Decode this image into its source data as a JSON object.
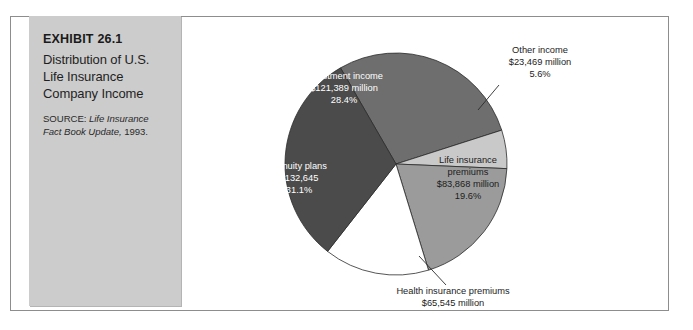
{
  "exhibit": {
    "number": "EXHIBIT 26.1",
    "title": "Distribution of U.S. Life Insurance Company Income",
    "source_label": "SOURCE: ",
    "source_title": "Life Insurance Fact Book Update,",
    "source_year": " 1993."
  },
  "chart_data": {
    "type": "pie",
    "title": "Distribution of U.S. Life Insurance Company Income",
    "xlabel": "",
    "ylabel": "",
    "legend_position": "labels-on-slices",
    "grid": false,
    "units": "millions of U.S. dollars",
    "categories": [
      "Investment income",
      "Other income",
      "Life insurance premiums",
      "Health insurance premiums",
      "Annuity plans"
    ],
    "values": [
      121389,
      23469,
      83868,
      65545,
      132645
    ],
    "percents": [
      28.4,
      5.6,
      19.6,
      15.3,
      31.1
    ],
    "slices": [
      {
        "name": "investment-income",
        "label": "Investment income",
        "value_text": "$121,389 million",
        "percent_text": "28.4%",
        "value": 121389,
        "percent": 28.4,
        "color": "#6e6e6e",
        "label_placement": "inside",
        "label_color": "on-dark"
      },
      {
        "name": "other-income",
        "label": "Other income",
        "value_text": "$23,469 million",
        "percent_text": "5.6%",
        "value": 23469,
        "percent": 5.6,
        "color": "#c9c9c9",
        "label_placement": "callout",
        "label_color": "on-light"
      },
      {
        "name": "life-insurance-premiums",
        "label": "Life insurance",
        "label2": "premiums",
        "value_text": "$83,868 million",
        "percent_text": "19.6%",
        "value": 83868,
        "percent": 19.6,
        "color": "#9b9b9b",
        "label_placement": "inside",
        "label_color": "on-light"
      },
      {
        "name": "health-insurance-premiums",
        "label": "Health insurance premiums",
        "value_text": "$65,545 million",
        "percent_text": "15.3%",
        "value": 65545,
        "percent": 15.3,
        "color": "#ffffff",
        "label_placement": "callout",
        "label_color": "on-light"
      },
      {
        "name": "annuity-plans",
        "label": "Annuity plans",
        "value_text": "$132,645",
        "percent_text": "31.1%",
        "value": 132645,
        "percent": 31.1,
        "color": "#4b4b4b",
        "label_placement": "inside",
        "label_color": "on-dark"
      }
    ]
  }
}
